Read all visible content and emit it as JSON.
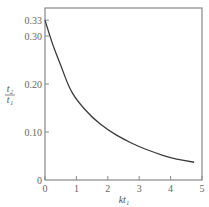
{
  "chart_data": {
    "type": "line",
    "title": "",
    "xlabel": "kt₁",
    "ylabel": "t₂/t₁",
    "xlim": [
      0,
      5
    ],
    "ylim": [
      0,
      0.35
    ],
    "grid": false,
    "legend": null,
    "x_ticks": [
      "0",
      "1",
      "2",
      "3",
      "4",
      "5"
    ],
    "y_ticks": [
      "0",
      "0.10",
      "0.20",
      "0.30",
      "0.33"
    ],
    "series": [
      {
        "name": "t2/t1",
        "x": [
          0,
          0.25,
          0.5,
          0.75,
          1,
          1.5,
          2,
          2.5,
          3,
          3.5,
          4,
          4.75
        ],
        "values": [
          0.333,
          0.28,
          0.24,
          0.195,
          0.167,
          0.13,
          0.104,
          0.085,
          0.069,
          0.057,
          0.046,
          0.037
        ]
      }
    ],
    "colors": {
      "line": "#3a3a3a",
      "axis": "#888888"
    }
  }
}
